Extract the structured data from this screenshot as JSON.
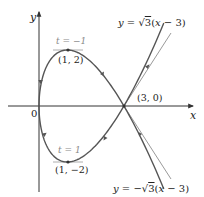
{
  "figure": {
    "type": "parametric-curve-diagram",
    "curve_description": "Tschirnhausen cubic x = t^2, y = t^3 - 3t with tangent lines at (3,0)",
    "axes": {
      "x_label": "x",
      "y_label": "y",
      "origin_label": "0"
    },
    "points": [
      {
        "id": "top",
        "label": "(1, 2)",
        "param_label": "t = −1",
        "x": 1,
        "y": 2
      },
      {
        "id": "bottom",
        "label": "(1, −2)",
        "param_label": "t = 1",
        "x": 1,
        "y": -2
      },
      {
        "id": "self-intersection",
        "label": "(3, 0)",
        "x": 3,
        "y": 0
      }
    ],
    "tangent_lines": [
      {
        "id": "upper",
        "equation_prefix": "y = ",
        "equation_body": "3(x − 3)",
        "sign": "",
        "display": "y = √3(x − 3)"
      },
      {
        "id": "lower",
        "equation_prefix": "y = −",
        "equation_body": "3(x − 3)",
        "sign": "−",
        "display": "y = −√3(x − 3)"
      }
    ],
    "colors": {
      "curve": "#555555",
      "axes": "#333333",
      "tangent": "#9a9a9a",
      "param_label": "#8a8a8a",
      "text": "#222222"
    }
  }
}
